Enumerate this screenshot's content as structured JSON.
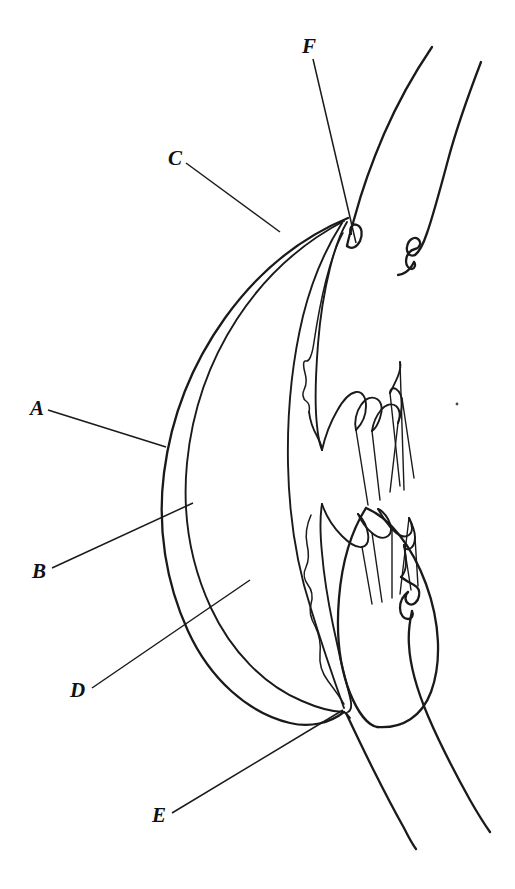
{
  "figure": {
    "background_color": "#ffffff",
    "ink_color": "#1a1a1a",
    "width": 515,
    "height": 889
  },
  "labels": [
    {
      "id": "A",
      "text": "A",
      "x": 30,
      "y": 415,
      "leader_from": [
        48,
        410
      ],
      "leader_to": [
        166,
        447
      ]
    },
    {
      "id": "B",
      "text": "B",
      "x": 32,
      "y": 578,
      "leader_from": [
        52,
        568
      ],
      "leader_to": [
        193,
        503
      ]
    },
    {
      "id": "C",
      "text": "C",
      "x": 168,
      "y": 165,
      "leader_from": [
        186,
        163
      ],
      "leader_to": [
        280,
        232
      ]
    },
    {
      "id": "D",
      "text": "D",
      "x": 70,
      "y": 697,
      "leader_from": [
        92,
        688
      ],
      "leader_to": [
        250,
        580
      ]
    },
    {
      "id": "E",
      "text": "E",
      "x": 152,
      "y": 822,
      "leader_from": [
        172,
        813
      ],
      "leader_to": [
        343,
        710
      ]
    },
    {
      "id": "F",
      "text": "F",
      "x": 302,
      "y": 53,
      "leader_from": [
        313,
        59
      ],
      "leader_to": [
        356,
        243
      ]
    }
  ],
  "structures": [
    {
      "name": "outer-cornea-sclera-arc"
    },
    {
      "name": "inner-cornea-arc"
    },
    {
      "name": "anterior-chamber"
    },
    {
      "name": "iris-anterior-surface"
    },
    {
      "name": "iris-posterior-pigment-layer"
    },
    {
      "name": "lens"
    },
    {
      "name": "ciliary-body-upper"
    },
    {
      "name": "ciliary-body-lower"
    },
    {
      "name": "ciliary-processes-upper"
    },
    {
      "name": "ciliary-processes-lower"
    },
    {
      "name": "zonular-fibres-upper"
    },
    {
      "name": "zonular-fibres-lower"
    },
    {
      "name": "sclera-outer-wall-upper"
    },
    {
      "name": "sclera-outer-wall-lower"
    },
    {
      "name": "vitreous-boundary-upper"
    },
    {
      "name": "vitreous-boundary-lower"
    }
  ]
}
